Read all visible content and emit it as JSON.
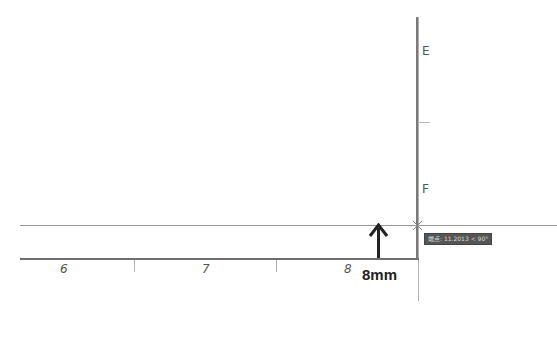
{
  "ruler": {
    "horizontal_labels": [
      "6",
      "7",
      "8"
    ],
    "vertical_labels": [
      "E",
      "F"
    ]
  },
  "measurement": {
    "label": "8mm",
    "arrow": "arrow-up-icon"
  },
  "tooltip": {
    "text": "端点: 11.2013 < 90°"
  },
  "colors": {
    "ruler": "#6e6e6e",
    "guide": "#9a9a9a",
    "tooltip_bg": "#555555",
    "text": "#222222"
  }
}
